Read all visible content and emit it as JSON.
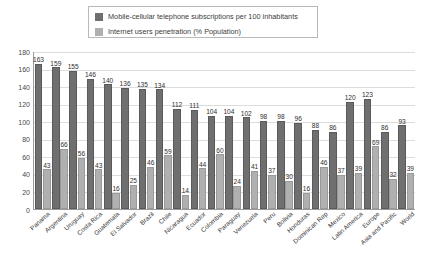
{
  "legend": {
    "items": [
      {
        "label": "Mobile-cellular telephone subscriptions per 100 inhabitants",
        "color": "#6f6f6f",
        "key": "mobile"
      },
      {
        "label": "Internet users penetration (% Population)",
        "color": "#b0b0b0",
        "key": "internet"
      }
    ]
  },
  "axis": {
    "y_ticks": [
      "180",
      "160",
      "140",
      "120",
      "100",
      "80",
      "60",
      "40",
      "20",
      "0"
    ]
  },
  "chart_data": {
    "type": "bar",
    "title": "",
    "subtitle": "",
    "xlabel": "",
    "ylabel": "",
    "ylim": [
      0,
      180
    ],
    "ytick_step": 20,
    "grid": true,
    "legend_position": "top",
    "categories": [
      "Panama",
      "Argentina",
      "Uruguay",
      "Costa Rica",
      "Guatemala",
      "El Salvador",
      "Brazil",
      "Chile",
      "Nicaragua",
      "Ecuador",
      "Colombia",
      "Paraguay",
      "Venezuela",
      "Peru",
      "Bolivia",
      "Honduras",
      "Dominican Rep",
      "Mexico",
      "Latin America",
      "Europe",
      "Asia and Pacific",
      "World"
    ],
    "series": [
      {
        "name": "Mobile-cellular telephone subscriptions per 100 inhabitants",
        "color": "#6f6f6f",
        "values": [
          163,
          159,
          155,
          146,
          140,
          136,
          135,
          134,
          112,
          111,
          104,
          104,
          102,
          98,
          98,
          96,
          88,
          86,
          120,
          123,
          86,
          93
        ]
      },
      {
        "name": "Internet users penetration (% Population)",
        "color": "#b0b0b0",
        "values": [
          43,
          66,
          56,
          43,
          16,
          25,
          46,
          59,
          14,
          44,
          60,
          24,
          41,
          37,
          30,
          16,
          46,
          37,
          39,
          69,
          32,
          39
        ]
      }
    ]
  }
}
